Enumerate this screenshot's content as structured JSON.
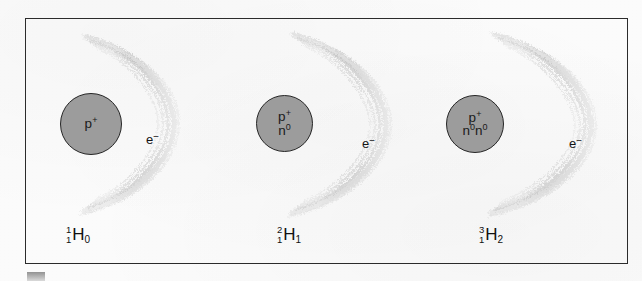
{
  "figure": {
    "type": "hydrogen-isotopes-diagram",
    "frame_border_color": "#2b2b2b",
    "background_color": "#fbfbfb",
    "nucleus_fill_color": "#9c9c9c",
    "nucleus_stroke_color": "#262626",
    "electron_cloud_color": "#8c8c8c",
    "atoms": [
      {
        "id": "protium",
        "nucleus_lines": [
          "p+",
          "n0-none"
        ],
        "nucleus_particles": [
          {
            "symbol": "p",
            "charge": "+"
          }
        ],
        "electron_label": "e",
        "electron_charge": "-",
        "isotope": {
          "mass_number": "1",
          "atomic_number": "1",
          "element_symbol": "H",
          "neutron_number": "0"
        }
      },
      {
        "id": "deuterium",
        "nucleus_particles": [
          {
            "symbol": "p",
            "charge": "+"
          },
          {
            "symbol": "n",
            "charge": "0"
          }
        ],
        "electron_label": "e",
        "electron_charge": "-",
        "isotope": {
          "mass_number": "2",
          "atomic_number": "1",
          "element_symbol": "H",
          "neutron_number": "1"
        }
      },
      {
        "id": "tritium",
        "nucleus_particles": [
          {
            "symbol": "p",
            "charge": "+"
          },
          {
            "symbol": "n",
            "charge": "0"
          },
          {
            "symbol": "n",
            "charge": "0"
          }
        ],
        "electron_label": "e",
        "electron_charge": "-",
        "isotope": {
          "mass_number": "3",
          "atomic_number": "1",
          "element_symbol": "H",
          "neutron_number": "2"
        }
      }
    ]
  },
  "atoms_text": {
    "a0": {
      "nuc_row1": "p",
      "nuc_row1_sup": "+",
      "e": "e",
      "e_sup": "−",
      "mass": "1",
      "atomic": "1",
      "sym": "H",
      "neutrons": "0"
    },
    "a1": {
      "nuc_row1": "p",
      "nuc_row1_sup": "+",
      "nuc_row2": "n",
      "nuc_row2_sup": "0",
      "e": "e",
      "e_sup": "−",
      "mass": "2",
      "atomic": "1",
      "sym": "H",
      "neutrons": "1"
    },
    "a2": {
      "nuc_row1": "p",
      "nuc_row1_sup": "+",
      "nuc_row2_a": "n",
      "nuc_row2_a_sup": "0",
      "nuc_row2_b": "n",
      "nuc_row2_b_sup": "0",
      "e": "e",
      "e_sup": "−",
      "mass": "3",
      "atomic": "1",
      "sym": "H",
      "neutrons": "2"
    }
  }
}
